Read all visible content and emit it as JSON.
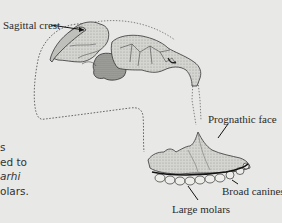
{
  "figure": {
    "labels": {
      "sagittal_crest": "Sagittal crest",
      "prognathic_face": "Prognathic face",
      "broad_canines": "Broad canines",
      "large_molars": "Large molars"
    }
  },
  "body_text": {
    "lines": [
      {
        "text": "s",
        "italic": false
      },
      {
        "text": "ed to",
        "italic": false
      },
      {
        "text": "arhi",
        "italic": true
      },
      {
        "text": "olars.",
        "italic": false
      }
    ]
  },
  "colors": {
    "background": "#e8e8e6",
    "ink": "#2b2b2b",
    "bone_fill": "#c9c9c6",
    "bone_dark": "#8a8a86"
  }
}
